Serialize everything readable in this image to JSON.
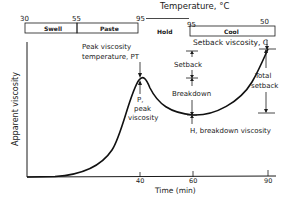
{
  "diagram": {
    "title": "Temperature, °C",
    "temperature_marks": [
      "30",
      "55",
      "95",
      "95",
      "50"
    ],
    "phases": [
      {
        "label": "Swell"
      },
      {
        "label": "Paste"
      },
      {
        "label": "Hold"
      },
      {
        "label": "Cool"
      }
    ],
    "y_axis_label": "Apparent viscosity",
    "x_axis_label": "Time (min)",
    "x_ticks": [
      "40",
      "60",
      "90"
    ],
    "annotations": {
      "peak_temp_line1": "Peak viscosity",
      "peak_temp_line2": "temperature, PT",
      "peak_line1": "P,",
      "peak_line2": "peak",
      "peak_line3": "viscosity",
      "setback_viscosity": "Setback viscosity, C",
      "setback": "Setback",
      "breakdown": "Breakdown",
      "breakdown_viscosity": "H, breakdown viscosity",
      "total_setback_line1": "Total",
      "total_setback_line2": "setback"
    }
  }
}
